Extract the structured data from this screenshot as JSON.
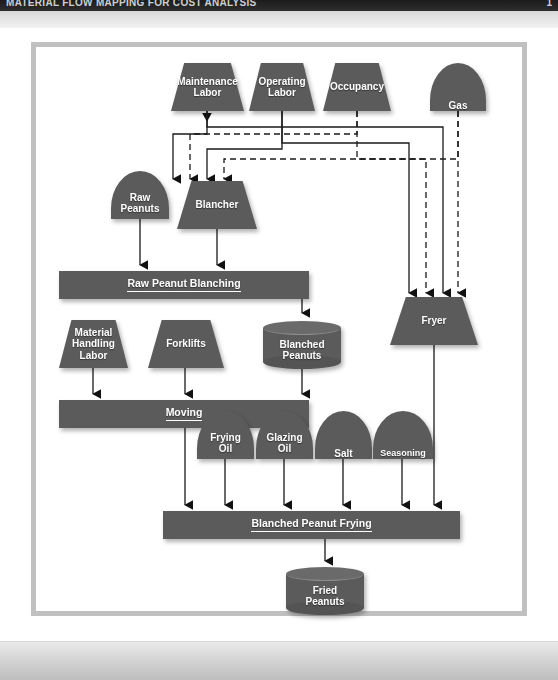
{
  "window": {
    "header_left": "MATERIAL FLOW MAPPING FOR COST ANALYSIS",
    "header_right": "1"
  },
  "theme": {
    "shape_fill": "#5b5b5b",
    "shape_text": "#ffffff",
    "connector": "#1a1a1a",
    "frame_border": "#c0c0c0",
    "page_background": "#ffffff"
  },
  "diagram": {
    "type": "process-flow",
    "resources": [
      {
        "id": "maintenance-labor",
        "label": "Maintenance\nLabor",
        "shape": "trapezoid"
      },
      {
        "id": "operating-labor",
        "label": "Operating\nLabor",
        "shape": "trapezoid"
      },
      {
        "id": "occupancy",
        "label": "Occupancy",
        "shape": "trapezoid"
      },
      {
        "id": "gas",
        "label": "Gas",
        "shape": "dome"
      },
      {
        "id": "raw-peanuts",
        "label": "Raw\nPeanuts",
        "shape": "dome"
      },
      {
        "id": "blancher",
        "label": "Blancher",
        "shape": "trapezoid"
      },
      {
        "id": "material-handling-labor",
        "label": "Material\nHandling\nLabor",
        "shape": "trapezoid"
      },
      {
        "id": "forklifts",
        "label": "Forklifts",
        "shape": "trapezoid"
      },
      {
        "id": "blanched-peanuts",
        "label": "Blanched\nPeanuts",
        "shape": "cylinder"
      },
      {
        "id": "fryer",
        "label": "Fryer",
        "shape": "trapezoid"
      },
      {
        "id": "frying-oil",
        "label": "Frying\nOil",
        "shape": "dome"
      },
      {
        "id": "glazing-oil",
        "label": "Glazing\nOil",
        "shape": "dome"
      },
      {
        "id": "salt",
        "label": "Salt",
        "shape": "dome"
      },
      {
        "id": "seasoning",
        "label": "Seasoning",
        "shape": "dome"
      },
      {
        "id": "fried-peanuts",
        "label": "Fried\nPeanuts",
        "shape": "cylinder"
      }
    ],
    "processes": [
      {
        "id": "raw-peanut-blanching",
        "label": "Raw Peanut Blanching",
        "shape": "bar"
      },
      {
        "id": "moving",
        "label": "Moving",
        "shape": "bar"
      },
      {
        "id": "blanched-peanut-frying",
        "label": "Blanched Peanut Frying",
        "shape": "bar"
      }
    ],
    "edges": [
      {
        "from": "maintenance-labor",
        "to": "blancher",
        "style": "solid"
      },
      {
        "from": "operating-labor",
        "to": "blancher",
        "style": "solid"
      },
      {
        "from": "occupancy",
        "to": "blancher",
        "style": "solid"
      },
      {
        "from": "gas",
        "to": "blancher",
        "style": "dashed"
      },
      {
        "from": "maintenance-labor",
        "to": "fryer",
        "style": "solid"
      },
      {
        "from": "operating-labor",
        "to": "fryer",
        "style": "solid"
      },
      {
        "from": "occupancy",
        "to": "fryer",
        "style": "dashed"
      },
      {
        "from": "gas",
        "to": "fryer",
        "style": "dashed"
      },
      {
        "from": "raw-peanuts",
        "to": "raw-peanut-blanching",
        "style": "solid"
      },
      {
        "from": "blancher",
        "to": "raw-peanut-blanching",
        "style": "solid"
      },
      {
        "from": "raw-peanut-blanching",
        "to": "blanched-peanuts",
        "style": "solid"
      },
      {
        "from": "material-handling-labor",
        "to": "moving",
        "style": "solid"
      },
      {
        "from": "forklifts",
        "to": "moving",
        "style": "solid"
      },
      {
        "from": "blanched-peanuts",
        "to": "moving",
        "style": "solid"
      },
      {
        "from": "moving",
        "to": "blanched-peanut-frying",
        "style": "solid"
      },
      {
        "from": "frying-oil",
        "to": "blanched-peanut-frying",
        "style": "solid"
      },
      {
        "from": "glazing-oil",
        "to": "blanched-peanut-frying",
        "style": "solid"
      },
      {
        "from": "salt",
        "to": "blanched-peanut-frying",
        "style": "solid"
      },
      {
        "from": "seasoning",
        "to": "blanched-peanut-frying",
        "style": "solid"
      },
      {
        "from": "fryer",
        "to": "blanched-peanut-frying",
        "style": "solid"
      },
      {
        "from": "blanched-peanut-frying",
        "to": "fried-peanuts",
        "style": "solid"
      }
    ]
  }
}
